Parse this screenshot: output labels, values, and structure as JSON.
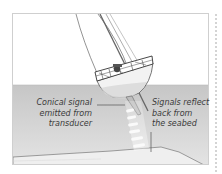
{
  "diagram": {
    "colors": {
      "sky": "#ffffff",
      "water": "#c9c9c9",
      "water_light": "#e2e2e2",
      "seabed": "#ededed",
      "line": "#555555",
      "frame_border": "#cfcfcf"
    },
    "callouts": [
      {
        "id": "signal-emitted",
        "lines": [
          "Conical signal",
          "emitted from",
          "transducer"
        ]
      },
      {
        "id": "signal-reflected",
        "lines": [
          "Signals reflect",
          "back from",
          "the seabed"
        ]
      }
    ]
  }
}
